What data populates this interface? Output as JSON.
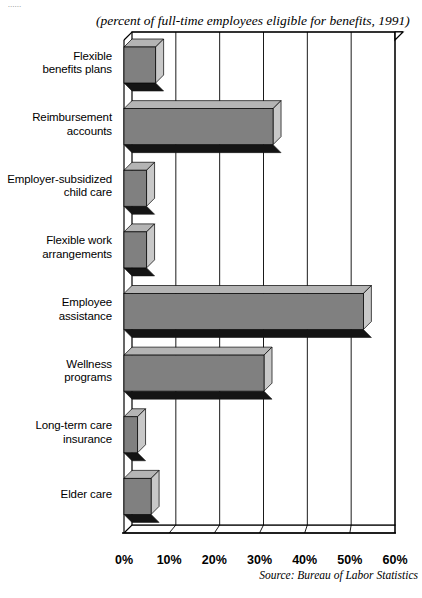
{
  "top_sliver_text": "......",
  "subtitle": "(percent of full-time employees eligible for benefits, 1991)",
  "source_note": "Source: Bureau of Labor Statistics",
  "chart_data": {
    "type": "bar",
    "orientation": "horizontal",
    "style": "3d",
    "title": "",
    "subtitle": "(percent of full-time employees eligible for benefits, 1991)",
    "xlabel": "",
    "ylabel": "",
    "xlim": [
      0,
      60
    ],
    "grid": true,
    "grid_axis": "x",
    "legend": null,
    "source": "Source: Bureau of Labor Statistics",
    "tick_labels": [
      "0%",
      "10%",
      "20%",
      "30%",
      "40%",
      "50%",
      "60%"
    ],
    "tick_values": [
      0,
      10,
      20,
      30,
      40,
      50,
      60
    ],
    "categories": [
      "Flexible benefits plans",
      "Reimbursement accounts",
      "Employer-subsidized child care",
      "Flexible work arrangements",
      "Employee assistance",
      "Wellness programs",
      "Long-term care insurance",
      "Elder care"
    ],
    "category_lines": [
      [
        "Flexible",
        "benefits plans"
      ],
      [
        "Reimbursement",
        "accounts"
      ],
      [
        "Employer-subsidized",
        "child care"
      ],
      [
        "Flexible work",
        "arrangements"
      ],
      [
        "Employee",
        "assistance"
      ],
      [
        "Wellness",
        "programs"
      ],
      [
        "Long-term care",
        "insurance"
      ],
      [
        "Elder  care"
      ]
    ],
    "values": [
      7,
      33,
      5,
      5,
      53,
      31,
      3,
      6
    ],
    "unit": "percent",
    "colors": {
      "bar_face": "#808080",
      "bar_side": "#c8c8c8",
      "bar_top": "#b4b4b4",
      "bar_shadow": "#141414",
      "axis": "#000000",
      "grid": "#000000",
      "background": "#ffffff"
    }
  }
}
